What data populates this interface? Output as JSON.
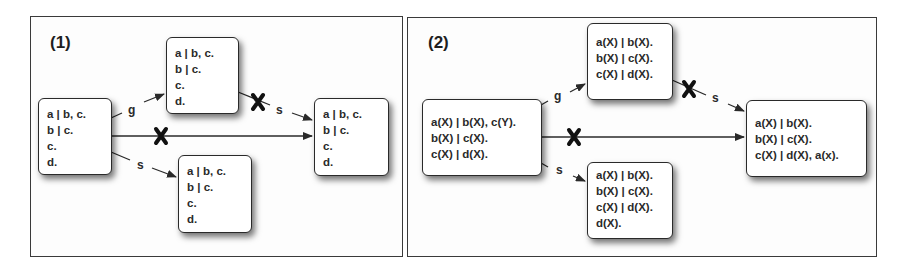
{
  "panels": [
    {
      "label": "(1)",
      "nodes": {
        "source": [
          "a | b, c.",
          "b | c.",
          "c.",
          "d."
        ],
        "top": [
          "a | b, c.",
          "b | c.",
          "c.",
          "d."
        ],
        "bottom": [
          "a | b, c.",
          "b | c.",
          "c.",
          "d."
        ],
        "target": [
          "a | b, c.",
          "b | c.",
          "c.",
          "d."
        ]
      },
      "edges": [
        {
          "from": "source",
          "to": "top",
          "label": "g",
          "blocked": false
        },
        {
          "from": "source",
          "to": "bottom",
          "label": "s",
          "blocked": false
        },
        {
          "from": "top",
          "to": "target",
          "label": "s",
          "blocked": true
        },
        {
          "from": "source",
          "to": "target",
          "label": "",
          "blocked": true
        }
      ]
    },
    {
      "label": "(2)",
      "nodes": {
        "source": [
          "a(X) | b(X), c(Y).",
          "b(X) | c(X).",
          "c(X) | d(X)."
        ],
        "top": [
          "a(X) | b(X).",
          "b(X) | c(X).",
          "c(X) | d(X)."
        ],
        "bottom": [
          "a(X) | b(X).",
          "b(X) | c(X).",
          "c(X) | d(X).",
          "d(X)."
        ],
        "target": [
          "a(X) | b(X).",
          "b(X) | c(X).",
          "c(X) | d(X), a(x)."
        ]
      },
      "edges": [
        {
          "from": "source",
          "to": "top",
          "label": "g",
          "blocked": false
        },
        {
          "from": "source",
          "to": "bottom",
          "label": "s",
          "blocked": false
        },
        {
          "from": "top",
          "to": "target",
          "label": "s",
          "blocked": true
        },
        {
          "from": "source",
          "to": "target",
          "label": "",
          "blocked": true
        }
      ]
    }
  ],
  "colors": {
    "stroke": "#2a2a2a",
    "cross": "#111111",
    "panel_border": "#3a3a3a"
  }
}
